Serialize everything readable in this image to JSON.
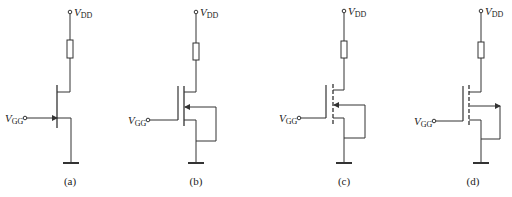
{
  "figure": {
    "panels": [
      {
        "id": "a",
        "caption": "(a)",
        "device": "junction FET (n-channel JFET)",
        "supply_label": {
          "v": "V",
          "sub": "DD"
        },
        "gate_label": {
          "v": "V",
          "sub": "GG"
        },
        "geom": {
          "vx": 70,
          "chx": 57,
          "gate_y": 118,
          "drain_y": 92,
          "src_y": 118,
          "vgg_x": 25
        }
      },
      {
        "id": "b",
        "caption": "(b)",
        "device": "enhancement... solid-channel MOSFET, body arrow inward",
        "supply_label": {
          "v": "V",
          "sub": "DD"
        },
        "gate_label": {
          "v": "V",
          "sub": "GG"
        },
        "geom": {
          "vx": 196,
          "gx": 178,
          "chx": 184,
          "drain_y": 92,
          "body_y": 107,
          "src_y": 120,
          "loop_x": 216,
          "loop_y": 141,
          "vgg_x": 148,
          "gate_y": 120,
          "dashed": false,
          "arrow": "in"
        }
      },
      {
        "id": "c",
        "caption": "(c)",
        "device": "enhancement MOSFET (dashed channel), body arrow inward",
        "supply_label": {
          "v": "V",
          "sub": "DD"
        },
        "gate_label": {
          "v": "V",
          "sub": "GG"
        },
        "geom": {
          "vx": 344,
          "gx": 326,
          "chx": 333,
          "drain_y": 90,
          "body_y": 105,
          "src_y": 118,
          "loop_x": 365,
          "loop_y": 138,
          "vgg_x": 299,
          "gate_y": 118,
          "dashed": true,
          "arrow": "in"
        }
      },
      {
        "id": "d",
        "caption": "(d)",
        "device": "enhancement MOSFET (dashed channel), body arrow outward",
        "supply_label": {
          "v": "V",
          "sub": "DD"
        },
        "gate_label": {
          "v": "V",
          "sub": "GG"
        },
        "geom": {
          "vx": 481,
          "gx": 463,
          "chx": 469,
          "drain_y": 92,
          "body_y": 106,
          "src_y": 120,
          "loop_x": 500,
          "loop_y": 139,
          "vgg_x": 434,
          "gate_y": 121,
          "dashed": true,
          "arrow": "out"
        }
      }
    ],
    "colors": {
      "line": "#333333",
      "background": "#ffffff"
    }
  }
}
